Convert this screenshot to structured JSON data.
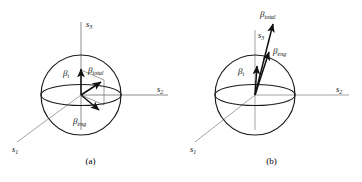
{
  "figure": {
    "type": "vector-diagram",
    "background": "#ffffff",
    "stroke_dark": "#1a1a1a",
    "stroke_light": "#9a9a9a"
  },
  "panels": [
    {
      "id": "a",
      "caption": "(a)",
      "axes": [
        {
          "name": "s1",
          "symbol": "s",
          "sub": "1",
          "position": "lower-left"
        },
        {
          "name": "s2",
          "symbol": "s",
          "sub": "2",
          "position": "right"
        },
        {
          "name": "s3",
          "symbol": "s",
          "sub": "3",
          "position": "top"
        }
      ],
      "vectors": [
        {
          "name": "beta-t",
          "symbol": "β",
          "sub": "t",
          "label": "βt",
          "direction": "up",
          "note": "vertical, toward s3 pole"
        },
        {
          "name": "beta-total",
          "symbol": "β",
          "sub": "total",
          "label": "βtotal",
          "direction": "up-right",
          "note": "resultant of beta-t and beta-eng"
        },
        {
          "name": "beta-eng",
          "symbol": "β",
          "sub": "eng",
          "label": "βeng",
          "direction": "down-right",
          "note": "below equatorial plane"
        }
      ],
      "construction_lines": true
    },
    {
      "id": "b",
      "caption": "(b)",
      "axes": [
        {
          "name": "s1",
          "symbol": "s",
          "sub": "1",
          "position": "lower-left"
        },
        {
          "name": "s2",
          "symbol": "s",
          "sub": "2",
          "position": "right"
        },
        {
          "name": "s3",
          "symbol": "s",
          "sub": "3",
          "position": "top"
        }
      ],
      "vectors": [
        {
          "name": "beta-t",
          "symbol": "β",
          "sub": "t",
          "label": "βt",
          "direction": "up",
          "note": "short, near vertical"
        },
        {
          "name": "beta-total",
          "symbol": "β",
          "sub": "total",
          "label": "βtotal",
          "direction": "up-slight-right",
          "note": "long, extends beyond sphere"
        },
        {
          "name": "beta-eng",
          "symbol": "β",
          "sub": "eng",
          "label": "βeng",
          "direction": "up-slight-right",
          "note": "nearly aligned with beta-total"
        }
      ],
      "construction_lines": false
    }
  ]
}
